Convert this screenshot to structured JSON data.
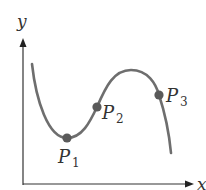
{
  "diagram": {
    "axes": {
      "x_label": "x",
      "y_label": "y",
      "color": "#333333"
    },
    "curve": {
      "color": "#6e6e6e",
      "description": "cubic-like curve: decreasing to a local minimum, rising to a local maximum, then falling"
    },
    "points": [
      {
        "name": "P",
        "subscript": "1",
        "role": "local minimum",
        "color": "#5a5a5a"
      },
      {
        "name": "P",
        "subscript": "2",
        "role": "inflection point on rising section",
        "color": "#5a5a5a"
      },
      {
        "name": "P",
        "subscript": "3",
        "role": "point on falling section after maximum",
        "color": "#5a5a5a"
      }
    ]
  }
}
